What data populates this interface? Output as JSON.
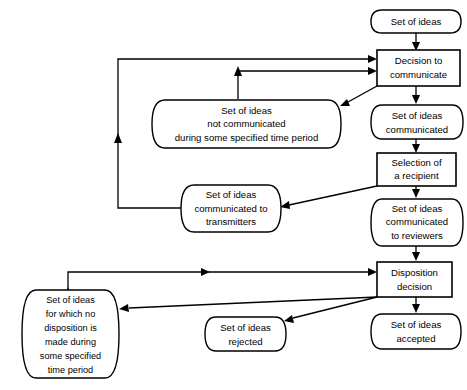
{
  "diagram": {
    "type": "flowchart",
    "colors": {
      "background": "#ffffff",
      "stroke": "#000000",
      "fill": "#ffffff"
    },
    "nodes": [
      {
        "id": "set-of-ideas",
        "shape": "rounded",
        "lines": [
          "Set of ideas"
        ]
      },
      {
        "id": "decision-to-communicate",
        "shape": "rectangle",
        "lines": [
          "Decision to",
          "communicate"
        ]
      },
      {
        "id": "set-of-ideas-communicated",
        "shape": "rounded",
        "lines": [
          "Set of ideas",
          "communicated"
        ]
      },
      {
        "id": "selection-of-a-recipient",
        "shape": "rectangle",
        "lines": [
          "Selection of",
          "a recipient"
        ]
      },
      {
        "id": "set-of-ideas-communicated-to-reviewers",
        "shape": "rounded",
        "lines": [
          "Set of ideas",
          "communicated",
          "to reviewers"
        ]
      },
      {
        "id": "disposition-decision",
        "shape": "rectangle",
        "lines": [
          "Disposition",
          "decision"
        ]
      },
      {
        "id": "set-of-ideas-accepted",
        "shape": "rounded",
        "lines": [
          "Set of ideas",
          "accepted"
        ]
      },
      {
        "id": "set-of-ideas-rejected",
        "shape": "rounded",
        "lines": [
          "Set of ideas",
          "rejected"
        ]
      },
      {
        "id": "set-of-ideas-no-disposition",
        "shape": "rounded",
        "lines": [
          "Set of ideas",
          "for which no",
          "disposition is",
          "made during",
          "some specified",
          "time period"
        ]
      },
      {
        "id": "set-of-ideas-not-communicated",
        "shape": "rounded",
        "lines": [
          "Set of ideas",
          "not communicated",
          "during some specified time period"
        ]
      },
      {
        "id": "set-of-ideas-communicated-to-transmitters",
        "shape": "rounded",
        "lines": [
          "Set of ideas",
          "communicated to",
          "transmitters"
        ]
      }
    ],
    "edges": [
      {
        "id": "e1",
        "from": "set-of-ideas",
        "to": "decision-to-communicate"
      },
      {
        "id": "e2",
        "from": "decision-to-communicate",
        "to": "set-of-ideas-communicated"
      },
      {
        "id": "e3",
        "from": "decision-to-communicate",
        "to": "set-of-ideas-not-communicated"
      },
      {
        "id": "e4",
        "from": "set-of-ideas-communicated",
        "to": "selection-of-a-recipient"
      },
      {
        "id": "e5",
        "from": "selection-of-a-recipient",
        "to": "set-of-ideas-communicated-to-reviewers"
      },
      {
        "id": "e6",
        "from": "selection-of-a-recipient",
        "to": "set-of-ideas-communicated-to-transmitters"
      },
      {
        "id": "e7",
        "from": "set-of-ideas-communicated-to-reviewers",
        "to": "disposition-decision"
      },
      {
        "id": "e8",
        "from": "disposition-decision",
        "to": "set-of-ideas-accepted"
      },
      {
        "id": "e9",
        "from": "disposition-decision",
        "to": "set-of-ideas-rejected"
      },
      {
        "id": "e10",
        "from": "disposition-decision",
        "to": "set-of-ideas-no-disposition"
      },
      {
        "id": "e11",
        "from": "set-of-ideas-not-communicated",
        "to": "decision-to-communicate"
      },
      {
        "id": "e12",
        "from": "set-of-ideas-communicated-to-transmitters",
        "to": "decision-to-communicate"
      },
      {
        "id": "e13",
        "from": "set-of-ideas-no-disposition",
        "to": "disposition-decision"
      }
    ]
  }
}
